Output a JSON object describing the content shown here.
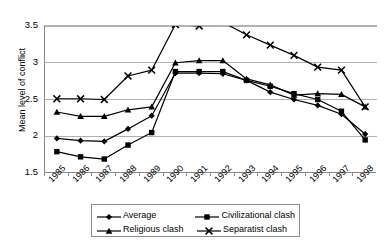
{
  "chart_data": {
    "type": "line",
    "title": "",
    "xlabel": "",
    "ylabel": "Mean level of conflict",
    "categories": [
      "1985",
      "1986",
      "1987",
      "1988",
      "1989",
      "1990",
      "1991",
      "1992",
      "1993",
      "1994",
      "1995",
      "1996",
      "1997",
      "1998"
    ],
    "yticks": [
      "1.5",
      "2",
      "2.5",
      "3",
      "3.5"
    ],
    "ylim": [
      1.5,
      3.5
    ],
    "grid": true,
    "legend_position": "bottom",
    "series": [
      {
        "name": "Average",
        "marker": "diamond",
        "values": [
          1.97,
          1.94,
          1.93,
          2.1,
          2.28,
          2.86,
          2.86,
          2.85,
          2.76,
          2.6,
          2.5,
          2.42,
          2.3,
          2.03
        ]
      },
      {
        "name": "Civilizational clash",
        "marker": "square",
        "values": [
          1.79,
          1.72,
          1.69,
          1.88,
          2.05,
          2.88,
          2.88,
          2.88,
          2.76,
          2.68,
          2.58,
          2.5,
          2.34,
          1.95
        ]
      },
      {
        "name": "Religious clash",
        "marker": "triangle",
        "values": [
          2.33,
          2.27,
          2.27,
          2.36,
          2.4,
          3.0,
          3.03,
          3.03,
          2.78,
          2.7,
          2.56,
          2.58,
          2.57,
          2.4
        ]
      },
      {
        "name": "Separatist clash",
        "marker": "x",
        "values": [
          2.51,
          2.51,
          2.5,
          2.82,
          2.9,
          3.52,
          3.5,
          3.55,
          3.38,
          3.24,
          3.1,
          2.94,
          2.9,
          2.4
        ]
      }
    ]
  },
  "legend": {
    "items": [
      {
        "label": "Average",
        "marker": "diamond"
      },
      {
        "label": "Civilizational clash",
        "marker": "square"
      },
      {
        "label": "Religious clash",
        "marker": "triangle"
      },
      {
        "label": "Separatist clash",
        "marker": "x"
      }
    ]
  },
  "colors": {
    "series": "#000000",
    "grid": "#b0b0b0",
    "axis": "#8a8a8a",
    "background": "#ffffff"
  }
}
